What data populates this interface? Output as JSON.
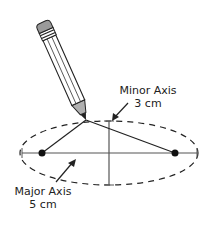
{
  "diagram": {
    "minor_axis": {
      "title": "Minor Axis",
      "value": "3 cm"
    },
    "major_axis": {
      "title": "Major Axis",
      "value": "5 cm"
    },
    "colors": {
      "stroke": "#222222",
      "pencil_fill": "#ffffff",
      "eraser": "#9a9a9a",
      "tip": "#b0b0b0"
    }
  }
}
